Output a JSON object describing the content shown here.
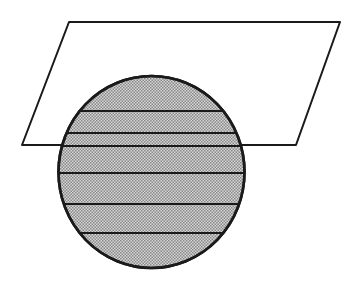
{
  "figure": {
    "canvas": {
      "width": 356,
      "height": 282,
      "background": "#ffffff"
    },
    "colors": {
      "stroke": "#1a1a1a",
      "plane_fill": "#ffffff",
      "sphere_fill": "#b8b8b8",
      "sphere_dither_dark": "#6e6e6e",
      "sphere_dither_light": "#e2e2e2"
    },
    "shapes": [
      {
        "name": "plane",
        "kind": "parallelogram",
        "label": "Plane",
        "fill": "#ffffff",
        "stroke": "#1a1a1a",
        "stroke_width": 2.0,
        "points": "69,22 340,22 296,145 22,145"
      },
      {
        "name": "sphere",
        "kind": "ellipse",
        "label": "Sphere",
        "fill": "#b8b8b8",
        "stroke": "#1a1a1a",
        "stroke_width": 2.6,
        "cx": 151.5,
        "cy": 172,
        "rx": 93,
        "ry": 96
      }
    ],
    "latitude_lines": {
      "name": "latitude-chords",
      "label": "Horizontal section lines",
      "stroke": "#1a1a1a",
      "stroke_width": 2.2,
      "y_values": [
        111,
        133,
        146,
        173,
        204,
        233
      ]
    }
  }
}
